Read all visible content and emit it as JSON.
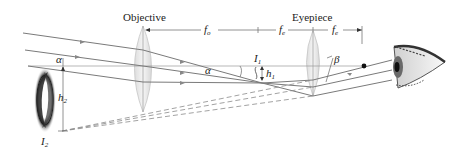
{
  "diagram": {
    "type": "refracting telescope ray diagram",
    "labels": {
      "objective": "Objective",
      "eyepiece": "Eyepiece",
      "f_o": "f",
      "f_o_sub": "o",
      "f_e_1": "f",
      "f_e_1_sub": "e",
      "f_e_2": "f",
      "f_e_2_sub": "e",
      "alpha_left": "α",
      "alpha_mid": "α",
      "beta": "β",
      "I1": "I",
      "I1_sub": "1",
      "h1": "h",
      "h1_sub": "1",
      "h2": "h",
      "h2_sub": "2",
      "I2": "I",
      "I2_sub": "2"
    },
    "colors": {
      "ray": "#7a7a7a",
      "lens_fill": "#e4e4e4",
      "lens_stroke": "#b5b5b5",
      "text": "#222222",
      "background": "#ffffff"
    },
    "elements": [
      "incoming parallel rays",
      "objective lens",
      "eyepiece lens",
      "intermediate image I1",
      "virtual image I2 (galaxy)",
      "eye",
      "focal point dot"
    ]
  }
}
